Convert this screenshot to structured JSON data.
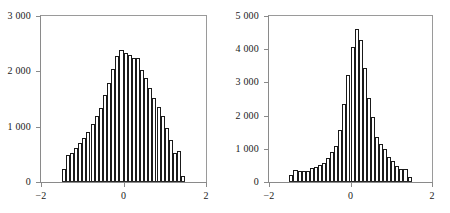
{
  "figure": {
    "background_color": "#ffffff",
    "bar_edge_color": "#1a1a1a",
    "bar_fill_color": "#ffffff",
    "axis_color": "#8a8a8a"
  },
  "chart_data": [
    {
      "type": "bar",
      "title": "",
      "subtitle": "",
      "xlabel": "",
      "ylabel": "",
      "xlim": [
        -2,
        2
      ],
      "ylim": [
        0,
        3000
      ],
      "xticks": [
        -2,
        0,
        2
      ],
      "xticklabels": [
        "−2",
        "0",
        "2"
      ],
      "yticks": [
        0,
        1000,
        2000,
        3000
      ],
      "yticklabels": [
        "0",
        "1 000",
        "2 000",
        "3 000"
      ],
      "grid": false,
      "legend": null,
      "bin_width": 0.1,
      "bin_left_edges": [
        -1.5,
        -1.4,
        -1.3,
        -1.2,
        -1.1,
        -1.0,
        -0.9,
        -0.8,
        -0.7,
        -0.6,
        -0.5,
        -0.4,
        -0.3,
        -0.2,
        -0.1,
        0.0,
        0.1,
        0.2,
        0.3,
        0.4,
        0.5,
        0.6,
        0.7,
        0.8,
        0.9,
        1.0,
        1.1,
        1.2,
        1.3,
        1.4
      ],
      "categories": [
        "-1.45",
        "-1.35",
        "-1.25",
        "-1.15",
        "-1.05",
        "-0.95",
        "-0.85",
        "-0.75",
        "-0.65",
        "-0.55",
        "-0.45",
        "-0.35",
        "-0.25",
        "-0.15",
        "-0.05",
        "0.05",
        "0.15",
        "0.25",
        "0.35",
        "0.45",
        "0.55",
        "0.65",
        "0.75",
        "0.85",
        "0.95",
        "1.05",
        "1.15",
        "1.25",
        "1.35",
        "1.45"
      ],
      "values": [
        230,
        480,
        520,
        610,
        700,
        800,
        900,
        1050,
        1200,
        1330,
        1580,
        1790,
        2040,
        2270,
        2390,
        2330,
        2300,
        2250,
        2250,
        2020,
        1880,
        1700,
        1520,
        1350,
        1200,
        980,
        760,
        530,
        560,
        100
      ]
    },
    {
      "type": "bar",
      "title": "",
      "subtitle": "",
      "xlabel": "",
      "ylabel": "",
      "xlim": [
        -2,
        2
      ],
      "ylim": [
        0,
        5000
      ],
      "xticks": [
        -2,
        0,
        2
      ],
      "xticklabels": [
        "−2",
        "0",
        "2"
      ],
      "yticks": [
        0,
        1000,
        2000,
        3000,
        4000,
        5000
      ],
      "yticklabels": [
        "0",
        "1 000",
        "2 000",
        "3 000",
        "4 000",
        "5 000"
      ],
      "grid": false,
      "legend": null,
      "bin_width": 0.1,
      "bin_left_edges": [
        -1.5,
        -1.4,
        -1.3,
        -1.2,
        -1.1,
        -1.0,
        -0.9,
        -0.8,
        -0.7,
        -0.6,
        -0.5,
        -0.4,
        -0.3,
        -0.2,
        -0.1,
        0.0,
        0.1,
        0.2,
        0.3,
        0.4,
        0.5,
        0.6,
        0.7,
        0.8,
        0.9,
        1.0,
        1.1,
        1.2,
        1.3,
        1.4
      ],
      "categories": [
        "-1.45",
        "-1.35",
        "-1.25",
        "-1.15",
        "-1.05",
        "-0.95",
        "-0.85",
        "-0.75",
        "-0.65",
        "-0.55",
        "-0.45",
        "-0.35",
        "-0.25",
        "-0.15",
        "-0.05",
        "0.05",
        "0.15",
        "0.25",
        "0.35",
        "0.45",
        "0.55",
        "0.65",
        "0.75",
        "0.85",
        "0.95",
        "1.05",
        "1.15",
        "1.25",
        "1.35",
        "1.45"
      ],
      "values": [
        220,
        350,
        330,
        340,
        330,
        420,
        460,
        500,
        560,
        720,
        890,
        1080,
        1560,
        2350,
        3220,
        4070,
        4620,
        4290,
        3430,
        2520,
        1960,
        1370,
        1130,
        1000,
        760,
        620,
        480,
        390,
        380,
        150
      ]
    }
  ]
}
